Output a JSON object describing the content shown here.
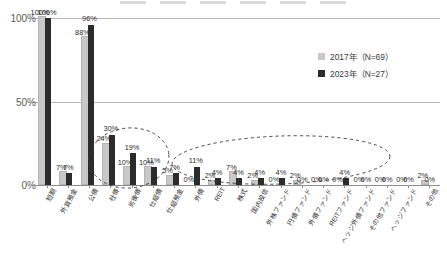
{
  "chart_data": {
    "type": "bar",
    "title": "",
    "subtitle": "",
    "xlabel": "",
    "ylabel": "",
    "ylim": [
      0,
      100
    ],
    "yticks": [
      "0%",
      "50%",
      "100%"
    ],
    "ytick_values": [
      0,
      50,
      100
    ],
    "grid": true,
    "legend_position": "top-right",
    "value_suffix": "%",
    "categories": [
      "短期",
      "外貨預金",
      "公債",
      "社債",
      "劣後債",
      "仕組債",
      "仕組預金",
      "外債",
      "REIT",
      "株式",
      "国内投信",
      "外株ファンド",
      "円債ファンド",
      "外債ファンド",
      "REITファンド",
      "ヘッジ外債ファンド",
      "その他ファンド",
      "ヘッジファンド",
      "その他"
    ],
    "series": [
      {
        "name": "2017年（N=69）",
        "color": "#c8c8c8",
        "values": [
          100,
          7,
          88,
          24,
          10,
          10,
          5,
          0,
          2,
          7,
          2,
          0,
          2,
          0,
          0,
          0,
          0,
          0,
          2
        ]
      },
      {
        "name": "2023年（N=27）",
        "color": "#2b2b2b",
        "values": [
          100,
          7,
          96,
          30,
          19,
          11,
          7,
          11,
          4,
          4,
          4,
          4,
          0,
          0,
          4,
          0,
          0,
          0,
          0
        ]
      }
    ],
    "annotations": [
      {
        "name": "ellipse-left",
        "shape": "dashed-ellipse",
        "covers": [
          "社債",
          "劣後債",
          "仕組債",
          "仕組預金"
        ]
      },
      {
        "name": "ellipse-right",
        "shape": "dashed-ellipse",
        "covers": [
          "外債",
          "REIT",
          "株式",
          "国内投信",
          "外株ファンド",
          "円債ファンド",
          "外債ファンド",
          "REITファンド",
          "ヘッジ外債ファンド"
        ]
      }
    ]
  },
  "legend": {
    "items": [
      {
        "label": "2017年（N=69）",
        "swatch": "s2017"
      },
      {
        "label": "2023年（N=27）",
        "swatch": "s2023"
      }
    ]
  }
}
